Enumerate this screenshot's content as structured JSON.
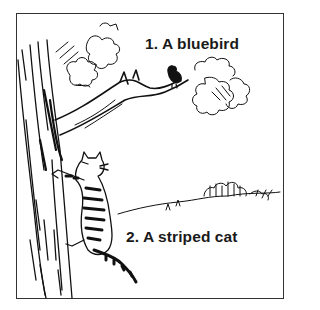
{
  "illustration": {
    "description": "Pen-and-ink drawing: a tree with a branch extending right, a small bird perched on the branch, a striped cat climbing the trunk, distant bushes on the horizon",
    "labels": {
      "item1": "1. A bluebird",
      "item2": "2. A striped cat"
    },
    "colors": {
      "ink": "#111111",
      "frame": "#333333",
      "background": "#ffffff"
    }
  }
}
